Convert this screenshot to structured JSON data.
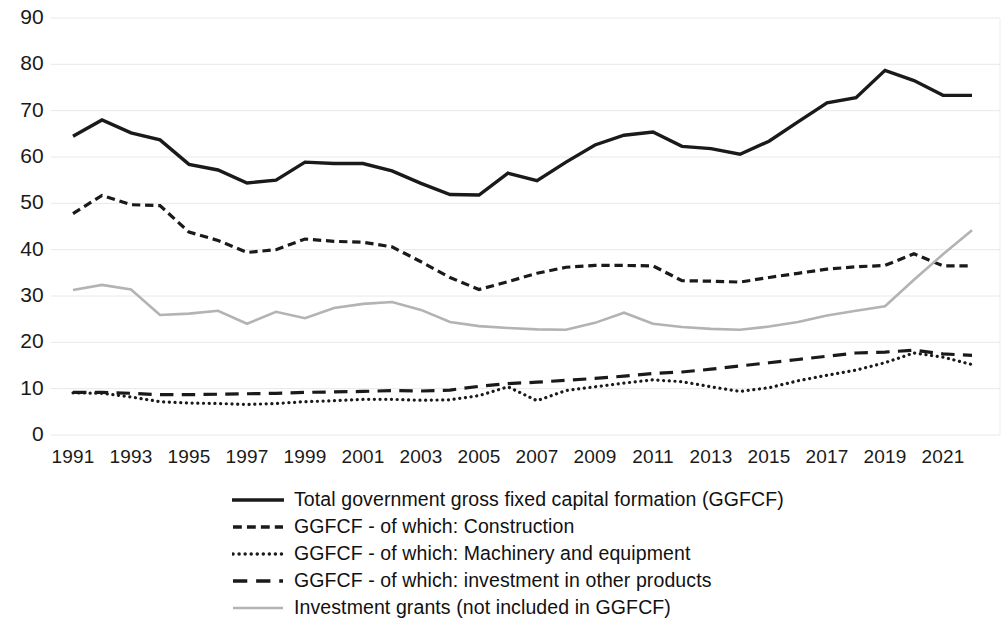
{
  "chart_data": {
    "type": "line",
    "title": "",
    "subtitle": "",
    "xlabel": "",
    "ylabel": "",
    "xlim": [
      1991,
      2022
    ],
    "ylim": [
      0,
      90
    ],
    "ytick_step": 10,
    "grid": true,
    "grid_axis": "y",
    "legend_position": "bottom",
    "x": [
      1991,
      1992,
      1993,
      1994,
      1995,
      1996,
      1997,
      1998,
      1999,
      2000,
      2001,
      2002,
      2003,
      2004,
      2005,
      2006,
      2007,
      2008,
      2009,
      2010,
      2011,
      2012,
      2013,
      2014,
      2015,
      2016,
      2017,
      2018,
      2019,
      2020,
      2021,
      2022
    ],
    "xticks": [
      "1991",
      "1993",
      "1995",
      "1997",
      "1999",
      "2001",
      "2003",
      "2005",
      "2007",
      "2009",
      "2011",
      "2013",
      "2015",
      "2017",
      "2019",
      "2021"
    ],
    "yticks": [
      "0",
      "10",
      "20",
      "30",
      "40",
      "50",
      "60",
      "70",
      "80",
      "90"
    ],
    "series": [
      {
        "name": "Total government gross fixed capital formation (GGFCF)",
        "style": "solid",
        "color": "#1a1a1a",
        "width": 3.4,
        "values": [
          64.5,
          68.0,
          65.2,
          63.7,
          58.4,
          57.2,
          54.4,
          55.0,
          58.9,
          58.6,
          58.6,
          57.0,
          54.3,
          51.9,
          51.8,
          56.5,
          54.9,
          58.9,
          62.6,
          64.7,
          65.4,
          62.3,
          61.8,
          60.6,
          63.4,
          67.6,
          71.7,
          72.8,
          78.7,
          76.5,
          73.3,
          73.3
        ]
      },
      {
        "name": "GGFCF - of which: Construction",
        "style": "dashed",
        "color": "#1a1a1a",
        "width": 3.2,
        "values": [
          47.8,
          51.7,
          49.7,
          49.5,
          43.8,
          42.0,
          39.4,
          40.0,
          42.3,
          41.8,
          41.6,
          40.6,
          37.4,
          34.0,
          31.4,
          33.1,
          34.9,
          36.2,
          36.6,
          36.6,
          36.5,
          33.3,
          33.2,
          33.0,
          34.0,
          34.9,
          35.8,
          36.3,
          36.6,
          39.1,
          36.5,
          36.5
        ]
      },
      {
        "name": "GGFCF - of which: Machinery and equipment",
        "style": "dotted",
        "color": "#1a1a1a",
        "width": 3.2,
        "values": [
          9.1,
          9.0,
          8.2,
          7.2,
          6.9,
          6.8,
          6.6,
          6.8,
          7.2,
          7.4,
          7.7,
          7.7,
          7.5,
          7.6,
          8.5,
          10.4,
          7.4,
          9.6,
          10.4,
          11.2,
          11.9,
          11.5,
          10.4,
          9.4,
          10.2,
          11.7,
          12.9,
          14.0,
          15.6,
          17.7,
          16.8,
          15.2
        ]
      },
      {
        "name": "GGFCF - of which: investment in other products",
        "style": "long-dashed",
        "color": "#1a1a1a",
        "width": 3.2,
        "values": [
          9.2,
          9.2,
          9.0,
          8.7,
          8.7,
          8.8,
          8.9,
          9.0,
          9.2,
          9.3,
          9.4,
          9.6,
          9.5,
          9.7,
          10.5,
          11.1,
          11.4,
          11.8,
          12.2,
          12.7,
          13.3,
          13.6,
          14.2,
          14.9,
          15.6,
          16.3,
          17.0,
          17.7,
          17.9,
          18.3,
          17.5,
          17.2
        ]
      },
      {
        "name": "Investment grants (not included in GGFCF)",
        "style": "solid",
        "color": "#b3b3b3",
        "width": 2.6,
        "values": [
          31.3,
          32.4,
          31.4,
          25.9,
          26.2,
          26.8,
          24.0,
          26.6,
          25.2,
          27.4,
          28.3,
          28.7,
          27.0,
          24.4,
          23.5,
          23.1,
          22.8,
          22.7,
          24.2,
          26.4,
          24.0,
          23.3,
          22.9,
          22.7,
          23.4,
          24.4,
          25.8,
          26.8,
          27.8,
          33.5,
          39.0,
          44.2
        ]
      }
    ]
  },
  "legend": {
    "items": [
      {
        "label": "Total government gross fixed capital formation (GGFCF)",
        "style": "solid",
        "color": "#1a1a1a"
      },
      {
        "label": "GGFCF - of which: Construction",
        "style": "dashed",
        "color": "#1a1a1a"
      },
      {
        "label": "GGFCF - of which: Machinery and equipment",
        "style": "dotted",
        "color": "#1a1a1a"
      },
      {
        "label": "GGFCF - of which: investment in other products",
        "style": "long-dashed",
        "color": "#1a1a1a"
      },
      {
        "label": "Investment grants (not included in GGFCF)",
        "style": "solid",
        "color": "#b3b3b3"
      }
    ]
  },
  "axes": {
    "grid_color": "#e8e8e8",
    "text_color": "#1a1a1a"
  }
}
